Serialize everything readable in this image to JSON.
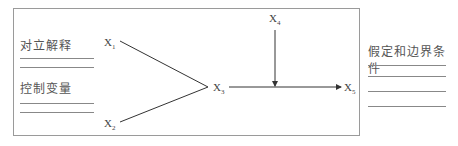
{
  "diagram": {
    "left_panel": {
      "group1_label": "对立解释",
      "group2_label": "控制变量"
    },
    "right_panel": {
      "label": "假定和边界条件"
    },
    "nodes": [
      {
        "id": "X1",
        "base": "X",
        "sub": "1"
      },
      {
        "id": "X2",
        "base": "X",
        "sub": "2"
      },
      {
        "id": "X3",
        "base": "X",
        "sub": "3"
      },
      {
        "id": "X4",
        "base": "X",
        "sub": "4"
      },
      {
        "id": "X5",
        "base": "X",
        "sub": "5"
      }
    ],
    "edges": [
      {
        "from": "X1",
        "to": "X3"
      },
      {
        "from": "X2",
        "to": "X3"
      },
      {
        "from": "X3",
        "to": "X5",
        "arrow": true
      },
      {
        "from": "X4",
        "to": "X3-X5 path",
        "arrow": true
      }
    ],
    "colors": {
      "line": "#333333",
      "border": "#9a9a9a"
    }
  }
}
